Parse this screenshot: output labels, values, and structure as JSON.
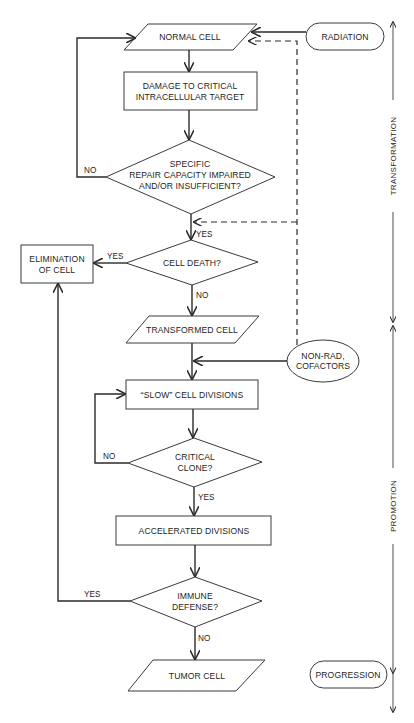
{
  "nodes": {
    "normal_cell": "NORMAL CELL",
    "damage": [
      "DAMAGE TO CRITICAL",
      "INTRACELLULAR TARGET"
    ],
    "repair": [
      "SPECIFIC",
      "REPAIR CAPACITY IMPAIRED",
      "AND/OR INSUFFICIENT?"
    ],
    "cell_death": "CELL DEATH?",
    "elimination": [
      "ELIMINATION",
      "OF CELL"
    ],
    "transformed_cell": "TRANSFORMED CELL",
    "slow_divisions": "“SLOW” CELL DIVISIONS",
    "critical_clone": [
      "CRITICAL",
      "CLONE?"
    ],
    "accelerated": "ACCELERATED DIVISIONS",
    "immune": [
      "IMMUNE",
      "DEFENSE?"
    ],
    "tumor_cell": "TUMOR CELL",
    "radiation": "RADIATION",
    "non_rad": [
      "NON-RAD,",
      "COFACTORS"
    ],
    "progression": "PROGRESSION"
  },
  "edges": {
    "repair_no": "NO",
    "repair_yes": "YES",
    "death_yes": "YES",
    "death_no": "NO",
    "clone_no": "NO",
    "clone_yes": "YES",
    "immune_yes": "YES",
    "immune_no": "NO"
  },
  "stages": {
    "transformation": "TRANSFORMATION",
    "promotion": "PROMOTION"
  }
}
